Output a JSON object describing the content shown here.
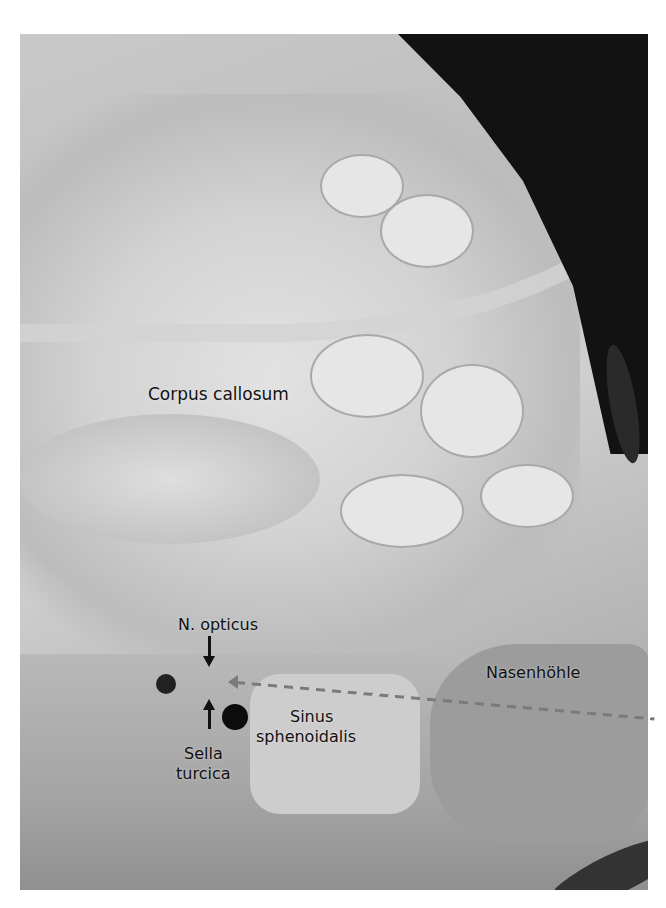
{
  "image": {
    "description": "Anatomical specimen photograph, sagittal section of head (grayscale)",
    "labels": {
      "corpus_callosum": "Corpus callosum",
      "n_opticus": "N. opticus",
      "sella_line1": "Sella",
      "sella_line2": "turcica",
      "sinus_line1": "Sinus",
      "sinus_line2": "sphenoidalis",
      "nasenhoehle": "Nasenhöhle"
    }
  }
}
